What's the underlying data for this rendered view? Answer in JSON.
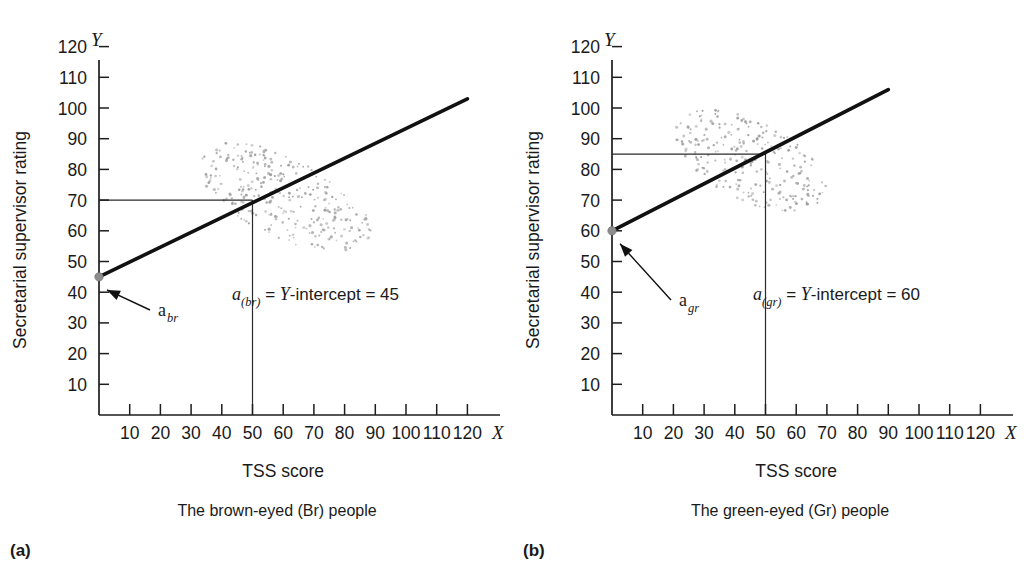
{
  "figure": {
    "title": "",
    "panels": [
      {
        "key": "a",
        "letter": "(a)",
        "caption": "The brown-eyed (Br) people",
        "x_axis": {
          "label": "TSS score",
          "letter": "X",
          "ticks": [
            "10",
            "20",
            "30",
            "40",
            "50",
            "60",
            "70",
            "80",
            "90",
            "100",
            "110",
            "120"
          ],
          "values": [
            10,
            20,
            30,
            40,
            50,
            60,
            70,
            80,
            90,
            100,
            110,
            120
          ],
          "min": 0,
          "max": 128
        },
        "y_axis": {
          "label": "Secretarial supervisor rating",
          "letter": "Y",
          "ticks": [
            "10",
            "20",
            "30",
            "40",
            "50",
            "60",
            "70",
            "80",
            "90",
            "100",
            "110",
            "120"
          ],
          "values": [
            10,
            20,
            30,
            40,
            50,
            60,
            70,
            80,
            90,
            100,
            110,
            120
          ],
          "min": 0,
          "max": 128
        },
        "annotation": {
          "a_symbol": "a",
          "a_subscript": "(br)",
          "equals1": " = ",
          "intercept_word": "Y",
          "intercept_text": "-intercept = ",
          "intercept_value": "45"
        },
        "pointer_label": {
          "symbol": "a",
          "subscript": "br"
        },
        "regression": {
          "intercept": 45,
          "slope": 0.4833,
          "x_start": 0,
          "x_end": 120
        },
        "guides": {
          "x_value": 50,
          "y_value": 70
        },
        "cloud": {
          "center_x": 60,
          "center_y": 71,
          "radius_x": 31,
          "radius_y": 13,
          "tilt_deg": -26,
          "n_points": 300
        }
      },
      {
        "key": "b",
        "letter": "(b)",
        "caption": "The green-eyed (Gr) people",
        "x_axis": {
          "label": "TSS score",
          "letter": "X",
          "ticks": [
            "10",
            "20",
            "30",
            "40",
            "50",
            "60",
            "70",
            "80",
            "90",
            "100",
            "110",
            "120"
          ],
          "values": [
            10,
            20,
            30,
            40,
            50,
            60,
            70,
            80,
            90,
            100,
            110,
            120
          ],
          "min": 0,
          "max": 128
        },
        "y_axis": {
          "label": "Secretarial supervisor rating",
          "letter": "Y",
          "ticks": [
            "10",
            "20",
            "30",
            "40",
            "50",
            "60",
            "70",
            "80",
            "90",
            "100",
            "110",
            "120"
          ],
          "values": [
            10,
            20,
            30,
            40,
            50,
            60,
            70,
            80,
            90,
            100,
            110,
            120
          ],
          "min": 0,
          "max": 128
        },
        "annotation": {
          "a_symbol": "a",
          "a_subscript": "(gr)",
          "equals1": " = ",
          "intercept_word": "Y",
          "intercept_text": "-intercept = ",
          "intercept_value": "60"
        },
        "pointer_label": {
          "symbol": "a",
          "subscript": "gr"
        },
        "regression": {
          "intercept": 60,
          "slope": 0.5111,
          "x_start": 0,
          "x_end": 90
        },
        "guides": {
          "x_value": 50,
          "y_value": 85
        },
        "cloud": {
          "center_x": 45,
          "center_y": 83,
          "radius_x": 27,
          "radius_y": 13,
          "tilt_deg": -27,
          "n_points": 250
        }
      }
    ]
  },
  "chart_data": {
    "type": "scatter",
    "panels": [
      {
        "name": "(a) The brown-eyed (Br) people",
        "xlabel": "TSS score",
        "ylabel": "Secretarial supervisor rating",
        "xlim": [
          0,
          128
        ],
        "ylim": [
          0,
          128
        ],
        "xticks": [
          10,
          20,
          30,
          40,
          50,
          60,
          70,
          80,
          90,
          100,
          110,
          120
        ],
        "yticks": [
          10,
          20,
          30,
          40,
          50,
          60,
          70,
          80,
          90,
          100,
          110,
          120
        ],
        "grid": false,
        "legend": "none",
        "series": [
          {
            "name": "Br regression line",
            "type": "line",
            "intercept": 45,
            "slope": 0.48,
            "x": [
              0,
              120
            ],
            "values": [
              45,
              103
            ]
          },
          {
            "name": "Br data cloud",
            "type": "scatter",
            "center": [
              60,
              71
            ],
            "x_range": [
              32,
              88
            ],
            "y_range": [
              54,
              90
            ]
          }
        ],
        "annotations": [
          {
            "text": "a(br) = Y-intercept = 45",
            "x": 62,
            "y": 40
          },
          {
            "text": "a_br",
            "x": 16,
            "y": 35
          },
          {
            "text": "Predicted Y = 70 at X = 50",
            "x": 50,
            "y": 70
          }
        ],
        "reference_lines": [
          {
            "orientation": "vertical",
            "value": 50
          },
          {
            "orientation": "horizontal",
            "value": 70
          }
        ]
      },
      {
        "name": "(b) The green-eyed (Gr) people",
        "xlabel": "TSS score",
        "ylabel": "Secretarial supervisor rating",
        "xlim": [
          0,
          128
        ],
        "ylim": [
          0,
          128
        ],
        "xticks": [
          10,
          20,
          30,
          40,
          50,
          60,
          70,
          80,
          90,
          100,
          110,
          120
        ],
        "yticks": [
          10,
          20,
          30,
          40,
          50,
          60,
          70,
          80,
          90,
          100,
          110,
          120
        ],
        "grid": false,
        "legend": "none",
        "series": [
          {
            "name": "Gr regression line",
            "type": "line",
            "intercept": 60,
            "slope": 0.51,
            "x": [
              0,
              90
            ],
            "values": [
              60,
              106
            ]
          },
          {
            "name": "Gr data cloud",
            "type": "scatter",
            "center": [
              45,
              83
            ],
            "x_range": [
              18,
              72
            ],
            "y_range": [
              62,
              100
            ]
          }
        ],
        "annotations": [
          {
            "text": "a(gr) = Y-intercept = 60",
            "x": 66,
            "y": 40
          },
          {
            "text": "a_gr",
            "x": 16,
            "y": 45
          },
          {
            "text": "Predicted Y = 85 at X = 50",
            "x": 50,
            "y": 85
          }
        ],
        "reference_lines": [
          {
            "orientation": "vertical",
            "value": 50
          },
          {
            "orientation": "horizontal",
            "value": 85
          }
        ]
      }
    ]
  }
}
